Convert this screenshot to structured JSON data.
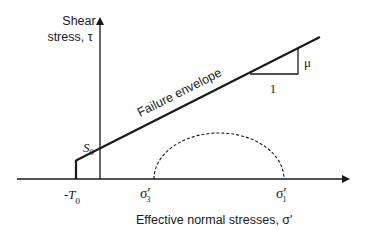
{
  "diagram": {
    "type": "mohr-coulomb-failure-envelope",
    "y_axis_label_line1": "Shear",
    "y_axis_label_line2": "stress, τ",
    "x_axis_label": "Effective normal stresses, σ'",
    "envelope_label": "Failure envelope",
    "cohesion_label": "S",
    "cohesion_subscript": "0",
    "tensile_label_prefix": "-T",
    "tensile_subscript": "0",
    "sigma3_label": "σ′",
    "sigma3_subscript": "3",
    "sigma1_label": "σ′",
    "sigma1_subscript": "1",
    "slope_rise_label": "μ",
    "slope_run_label": "1",
    "colors": {
      "line": "#1a1a1a",
      "background": "#ffffff"
    }
  }
}
